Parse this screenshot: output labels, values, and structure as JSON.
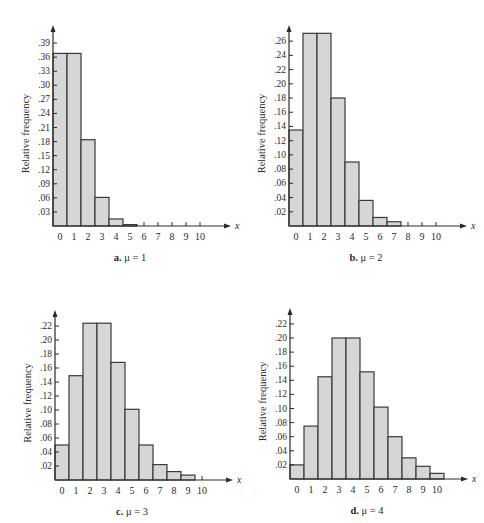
{
  "chart_data": [
    {
      "type": "bar",
      "panel": "a",
      "caption_letter": "a.",
      "caption_param": "μ = 1",
      "xlabel": "x",
      "ylabel": "Relative frequency",
      "categories": [
        "0",
        "1",
        "2",
        "3",
        "4",
        "5",
        "6",
        "7",
        "8",
        "9",
        "10"
      ],
      "values": [
        0.368,
        0.368,
        0.184,
        0.061,
        0.015,
        0.003,
        0.0005,
        0,
        0,
        0,
        0
      ],
      "yticks": [
        ".03",
        ".06",
        ".09",
        ".12",
        ".15",
        ".18",
        ".21",
        ".24",
        ".27",
        ".30",
        ".33",
        ".36",
        ".39"
      ],
      "ytick_values": [
        0.03,
        0.06,
        0.09,
        0.12,
        0.15,
        0.18,
        0.21,
        0.24,
        0.27,
        0.3,
        0.33,
        0.36,
        0.39
      ],
      "ylim": [
        0,
        0.4
      ],
      "grid": false
    },
    {
      "type": "bar",
      "panel": "b",
      "caption_letter": "b.",
      "caption_param": "μ = 2",
      "xlabel": "x",
      "ylabel": "Relative frequency",
      "categories": [
        "0",
        "1",
        "2",
        "3",
        "4",
        "5",
        "6",
        "7",
        "8",
        "9",
        "10"
      ],
      "values": [
        0.135,
        0.271,
        0.271,
        0.18,
        0.09,
        0.036,
        0.012,
        0.006,
        0.001,
        0,
        0
      ],
      "yticks": [
        ".02",
        ".04",
        ".06",
        ".08",
        ".10",
        ".12",
        ".14",
        ".16",
        ".18",
        ".20",
        ".22",
        ".24",
        ".26"
      ],
      "ytick_values": [
        0.02,
        0.04,
        0.06,
        0.08,
        0.1,
        0.12,
        0.14,
        0.16,
        0.18,
        0.2,
        0.22,
        0.24,
        0.26
      ],
      "ylim": [
        0,
        0.28
      ],
      "grid": false
    },
    {
      "type": "bar",
      "panel": "c",
      "caption_letter": "c.",
      "caption_param": "μ = 3",
      "xlabel": "x",
      "ylabel": "Relative frequency",
      "categories": [
        "0",
        "1",
        "2",
        "3",
        "4",
        "5",
        "6",
        "7",
        "8",
        "9",
        "10"
      ],
      "values": [
        0.05,
        0.149,
        0.224,
        0.224,
        0.168,
        0.101,
        0.05,
        0.022,
        0.012,
        0.007,
        0.001
      ],
      "yticks": [
        ".02",
        ".04",
        ".06",
        ".08",
        ".10",
        ".12",
        ".14",
        ".16",
        ".18",
        ".20",
        ".22"
      ],
      "ytick_values": [
        0.02,
        0.04,
        0.06,
        0.08,
        0.1,
        0.12,
        0.14,
        0.16,
        0.18,
        0.2,
        0.22
      ],
      "ylim": [
        0,
        0.24
      ],
      "grid": false
    },
    {
      "type": "bar",
      "panel": "d",
      "caption_letter": "d.",
      "caption_param": "μ = 4",
      "xlabel": "x",
      "ylabel": "Relative frequency",
      "categories": [
        "0",
        "1",
        "2",
        "3",
        "4",
        "5",
        "6",
        "7",
        "8",
        "9",
        "10"
      ],
      "values": [
        0.02,
        0.075,
        0.145,
        0.2,
        0.2,
        0.152,
        0.102,
        0.06,
        0.03,
        0.018,
        0.008
      ],
      "yticks": [
        ".02",
        ".04",
        ".06",
        ".08",
        ".10",
        ".12",
        ".14",
        ".16",
        ".18",
        ".20",
        ".22"
      ],
      "ytick_values": [
        0.02,
        0.04,
        0.06,
        0.08,
        0.1,
        0.12,
        0.14,
        0.16,
        0.18,
        0.2,
        0.22
      ],
      "ylim": [
        0,
        0.24
      ],
      "grid": false
    }
  ],
  "layout": [
    {
      "axis_x": 53,
      "base_y": 226,
      "top_y": 25,
      "px_per_unit": 469,
      "bar_w": 14
    },
    {
      "axis_x": 289,
      "base_y": 226,
      "top_y": 25,
      "px_per_unit": 711,
      "bar_w": 14
    },
    {
      "axis_x": 55,
      "base_y": 480,
      "top_y": 310,
      "px_per_unit": 700,
      "bar_w": 14
    },
    {
      "axis_x": 290,
      "base_y": 479,
      "top_y": 308,
      "px_per_unit": 705,
      "bar_w": 14
    }
  ],
  "colors": {
    "bar_fill": "#d6d6d6",
    "bar_stroke": "#3a3a3a",
    "axis": "#2a2a2a"
  }
}
